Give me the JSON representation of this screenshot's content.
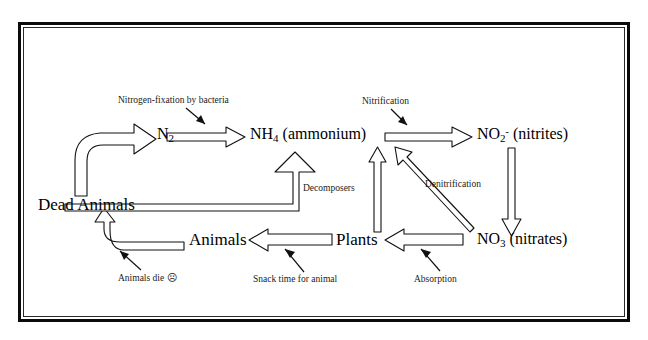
{
  "diagram": {
    "frame_color": "#0b0b0b",
    "background": "#ffffff",
    "nodes": [
      {
        "id": "n2",
        "label": "N",
        "sub": "2",
        "sup": "",
        "suffix": ""
      },
      {
        "id": "nh4",
        "label": "NH",
        "sub": "4",
        "sup": "",
        "suffix": " (ammonium)"
      },
      {
        "id": "no2",
        "label": "NO",
        "sub": "2",
        "sup": "-",
        "suffix": " (nitrites)"
      },
      {
        "id": "no3",
        "label": "NO",
        "sub": "3",
        "sup": "",
        "suffix": " (nitrates)"
      },
      {
        "id": "dead",
        "label": "Dead Animals",
        "sub": "",
        "sup": "",
        "suffix": ""
      },
      {
        "id": "animals",
        "label": "Animals",
        "sub": "",
        "sup": "",
        "suffix": ""
      },
      {
        "id": "plants",
        "label": "Plants",
        "sub": "",
        "sup": "",
        "suffix": ""
      }
    ],
    "annotations": [
      {
        "id": "fixation",
        "text": "Nitrogen-fixation by bacteria"
      },
      {
        "id": "nitrification",
        "text": "Nitrification"
      },
      {
        "id": "denitrification",
        "text": "Denitrification"
      },
      {
        "id": "decomposers",
        "text": "Decomposers"
      },
      {
        "id": "animals_die",
        "text": "Animals die"
      },
      {
        "id": "animals_die_face",
        "text": "☹"
      },
      {
        "id": "snack",
        "text": "Snack time for animal"
      },
      {
        "id": "absorption",
        "text": "Absorption"
      }
    ],
    "flows": [
      {
        "from": "dead",
        "to": "n2",
        "label": ""
      },
      {
        "from": "n2",
        "to": "nh4",
        "label": "Nitrogen-fixation by bacteria"
      },
      {
        "from": "nh4",
        "to": "no2",
        "label": "Nitrification"
      },
      {
        "from": "no2",
        "to": "no3",
        "label": ""
      },
      {
        "from": "no3",
        "to": "plants",
        "label": "Absorption"
      },
      {
        "from": "no3",
        "to": "nh4",
        "label": "Denitrification"
      },
      {
        "from": "plants",
        "to": "animals",
        "label": "Snack time for animal"
      },
      {
        "from": "plants",
        "to": "nh4",
        "label": ""
      },
      {
        "from": "animals",
        "to": "dead",
        "label": "Animals die"
      },
      {
        "from": "dead",
        "to": "nh4",
        "label": "Decomposers"
      }
    ]
  }
}
